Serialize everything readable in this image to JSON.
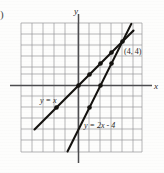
{
  "figure": {
    "item_marker": ")",
    "axis_labels": {
      "x": "x",
      "y": "y"
    },
    "point_label": "(4, 4)",
    "line1_label": "y = x",
    "line2_label": "y = 2x - 4",
    "colors": {
      "grid": "#8d8d92",
      "axis": "#4b4b4e",
      "line": "#14120f",
      "background": "#fdfdfc",
      "text": "#2b2926"
    }
  },
  "chart_data": {
    "type": "line",
    "title": "",
    "xlabel": "x",
    "ylabel": "y",
    "xlim": [
      -5,
      6
    ],
    "ylim": [
      -7,
      5
    ],
    "grid": true,
    "legend": "none",
    "annotations": [
      {
        "text": "(4, 4)",
        "x": 4,
        "y": 4
      },
      {
        "text": "y = x",
        "x": -2.3,
        "y": -1.5
      },
      {
        "text": "y = 2x - 4",
        "x": 1.4,
        "y": -4.1
      }
    ],
    "series": [
      {
        "name": "y = x",
        "equation": "y = x",
        "slope": 1,
        "intercept": 0,
        "x": [
          -4,
          5
        ],
        "y": [
          -4,
          5
        ],
        "points": [
          {
            "x": -2,
            "y": -2
          },
          {
            "x": -1,
            "y": -1
          },
          {
            "x": 0,
            "y": 0
          },
          {
            "x": 1,
            "y": 1
          },
          {
            "x": 2,
            "y": 2
          },
          {
            "x": 3,
            "y": 3
          },
          {
            "x": 4,
            "y": 4
          }
        ]
      },
      {
        "name": "y = 2x - 4",
        "equation": "y = 2x - 4",
        "slope": 2,
        "intercept": -4,
        "x": [
          -1,
          4.8
        ],
        "y": [
          -6,
          5.6
        ],
        "points": [
          {
            "x": 0,
            "y": -4
          },
          {
            "x": 1,
            "y": -2
          },
          {
            "x": 2,
            "y": 0
          },
          {
            "x": 3,
            "y": 2
          },
          {
            "x": 4,
            "y": 4
          }
        ]
      }
    ],
    "intersection": {
      "x": 4,
      "y": 4
    }
  }
}
